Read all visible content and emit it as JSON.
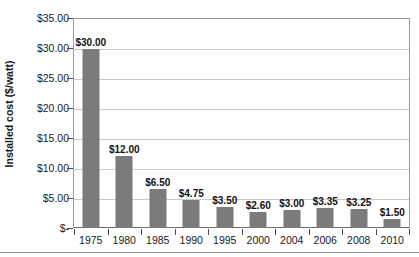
{
  "chart_data": {
    "type": "bar",
    "title": "",
    "xlabel": "",
    "ylabel": "Installed cost ($/watt)",
    "categories": [
      "1975",
      "1980",
      "1985",
      "1990",
      "1995",
      "2000",
      "2004",
      "2006",
      "2008",
      "2010"
    ],
    "values": [
      30.0,
      12.0,
      6.5,
      4.75,
      3.5,
      2.6,
      3.0,
      3.35,
      3.25,
      1.5
    ],
    "value_labels": [
      "$30.00",
      "$12.00",
      "$6.50",
      "$4.75",
      "$3.50",
      "$2.60",
      "$3.00",
      "$3.35",
      "$3.25",
      "$1.50"
    ],
    "ylim": [
      0,
      35
    ],
    "y_ticks": [
      35,
      30,
      25,
      20,
      15,
      10,
      5,
      0
    ],
    "y_tick_labels": [
      "$35.00",
      "$30.00",
      "$25.00",
      "$20.00",
      "$15.00",
      "$10.00",
      "$5.00",
      "$-"
    ],
    "grid": "horizontal",
    "legend": "none",
    "bar_color": "#7b7b7b",
    "gridline_color": "#c9c9c9",
    "axis_color": "#6e6e6e",
    "text_color": "#1a1a1a"
  }
}
